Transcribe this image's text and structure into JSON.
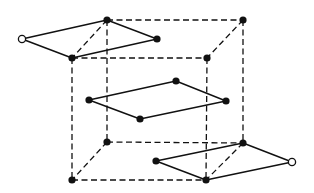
{
  "diagram": {
    "colors": {
      "stroke": "#111111",
      "background": "#ffffff",
      "dot_fill": "#111111",
      "open_dot_fill": "#ffffff"
    },
    "nodes": [
      {
        "id": "cube-top-back-left",
        "x": 107,
        "y": 20,
        "style": "filled"
      },
      {
        "id": "cube-top-back-right",
        "x": 243,
        "y": 20,
        "style": "filled"
      },
      {
        "id": "cube-top-front-left",
        "x": 72,
        "y": 58,
        "style": "filled"
      },
      {
        "id": "cube-top-front-right",
        "x": 207,
        "y": 58,
        "style": "filled"
      },
      {
        "id": "cube-bottom-back-left",
        "x": 107,
        "y": 142,
        "style": "filled"
      },
      {
        "id": "cube-bottom-back-right",
        "x": 243,
        "y": 143,
        "style": "filled"
      },
      {
        "id": "cube-bottom-front-left",
        "x": 72,
        "y": 180,
        "style": "filled"
      },
      {
        "id": "cube-bottom-front-right",
        "x": 206,
        "y": 180,
        "style": "filled"
      },
      {
        "id": "top-left-open",
        "x": 22,
        "y": 39,
        "style": "open"
      },
      {
        "id": "top-right",
        "x": 157,
        "y": 39,
        "style": "filled"
      },
      {
        "id": "mid-left",
        "x": 89,
        "y": 100,
        "style": "filled"
      },
      {
        "id": "mid-top",
        "x": 176,
        "y": 81,
        "style": "filled"
      },
      {
        "id": "mid-right",
        "x": 226,
        "y": 101,
        "style": "filled"
      },
      {
        "id": "mid-bottom",
        "x": 140,
        "y": 119,
        "style": "filled"
      },
      {
        "id": "bottom-left",
        "x": 156,
        "y": 161,
        "style": "filled"
      },
      {
        "id": "bottom-right-open",
        "x": 292,
        "y": 162,
        "style": "open"
      }
    ],
    "dashed_edges": [
      [
        "cube-top-back-left",
        "cube-top-back-right"
      ],
      [
        "cube-top-front-left",
        "cube-top-front-right"
      ],
      [
        "cube-top-back-right",
        "cube-top-front-right"
      ],
      [
        "cube-top-back-left",
        "cube-bottom-back-left"
      ],
      [
        "cube-top-back-right",
        "cube-bottom-back-right"
      ],
      [
        "cube-top-front-left",
        "cube-bottom-front-left"
      ],
      [
        "cube-top-front-right",
        "cube-bottom-front-right"
      ],
      [
        "cube-bottom-back-left",
        "cube-bottom-back-right"
      ],
      [
        "cube-bottom-front-left",
        "cube-bottom-front-right"
      ],
      [
        "cube-bottom-back-left",
        "cube-bottom-front-left"
      ],
      [
        "cube-top-back-left",
        "cube-top-front-left"
      ],
      [
        "cube-bottom-back-right",
        "cube-bottom-front-right"
      ]
    ],
    "solid_edges": [
      [
        "top-left-open",
        "cube-top-back-left"
      ],
      [
        "cube-top-back-left",
        "top-right"
      ],
      [
        "top-right",
        "cube-top-front-left"
      ],
      [
        "cube-top-front-left",
        "top-left-open"
      ],
      [
        "mid-left",
        "mid-top"
      ],
      [
        "mid-top",
        "mid-right"
      ],
      [
        "mid-right",
        "mid-bottom"
      ],
      [
        "mid-bottom",
        "mid-left"
      ],
      [
        "bottom-left",
        "cube-bottom-back-right"
      ],
      [
        "cube-bottom-back-right",
        "bottom-right-open"
      ],
      [
        "bottom-right-open",
        "cube-bottom-front-right"
      ],
      [
        "cube-bottom-front-right",
        "bottom-left"
      ]
    ]
  }
}
